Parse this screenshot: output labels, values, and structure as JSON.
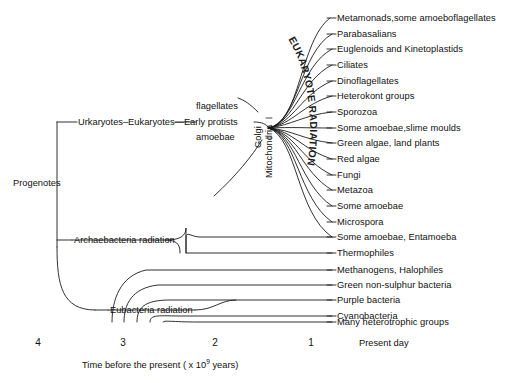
{
  "diagram": {
    "root_label": "Progenotes",
    "lineage_chain": "Urkaryotes–Eukaryotes—Early protists",
    "protist_upper": "flagellates",
    "protist_lower": "amoebae",
    "organelles": [
      "Golgi",
      "Mitochondria"
    ],
    "radiations": [
      {
        "name": "eukaryote-radiation",
        "label": "EUKARYOTE RADIATION",
        "orientation": "arc"
      },
      {
        "name": "archaebacteria-radiation",
        "label": "Archaebacteria radiation",
        "orientation": "horizontal"
      },
      {
        "name": "eubacteria-radiation",
        "label": "Eubacteria radiation",
        "orientation": "horizontal"
      }
    ],
    "line_color": "#1a1a1a",
    "background": "#ffffff"
  },
  "taxa": [
    {
      "label": "Metamonads,some amoeboflagellates",
      "group": "eukaryote"
    },
    {
      "label": "Parabasalians",
      "group": "eukaryote"
    },
    {
      "label": "Euglenoids and Kinetoplastids",
      "group": "eukaryote"
    },
    {
      "label": "Ciliates",
      "group": "eukaryote"
    },
    {
      "label": "Dinoflagellates",
      "group": "eukaryote"
    },
    {
      "label": "Heterokont groups",
      "group": "eukaryote"
    },
    {
      "label": "Sporozoa",
      "group": "eukaryote"
    },
    {
      "label": "Some amoebae,slime moulds",
      "group": "eukaryote"
    },
    {
      "label": "Green algae, land plants",
      "group": "eukaryote"
    },
    {
      "label": "Red algae",
      "group": "eukaryote"
    },
    {
      "label": "Fungi",
      "group": "eukaryote"
    },
    {
      "label": "Metazoa",
      "group": "eukaryote"
    },
    {
      "label": "Some amoebae",
      "group": "eukaryote"
    },
    {
      "label": "Microspora",
      "group": "eukaryote"
    },
    {
      "label": "Some amoebae, Entamoeba",
      "group": "eukaryote"
    },
    {
      "label": "Thermophiles",
      "group": "archaebacteria"
    },
    {
      "label": "Methanogens, Halophiles",
      "group": "archaebacteria"
    },
    {
      "label": "Green non-sulphur bacteria",
      "group": "eubacteria"
    },
    {
      "label": "Purple bacteria",
      "group": "eubacteria"
    },
    {
      "label": "Cyanobacteria",
      "group": "eubacteria"
    },
    {
      "label": "Green sulphur bacteria",
      "group": "eubacteria"
    },
    {
      "label": "Many heterotrophic groups",
      "group": "eubacteria"
    }
  ],
  "axis": {
    "caption_prefix": "Time before the present  ( x 10",
    "caption_exponent": "9",
    "caption_suffix": " years)",
    "ticks": [
      "4",
      "3",
      "2",
      "1"
    ],
    "present_label": "Present day"
  }
}
